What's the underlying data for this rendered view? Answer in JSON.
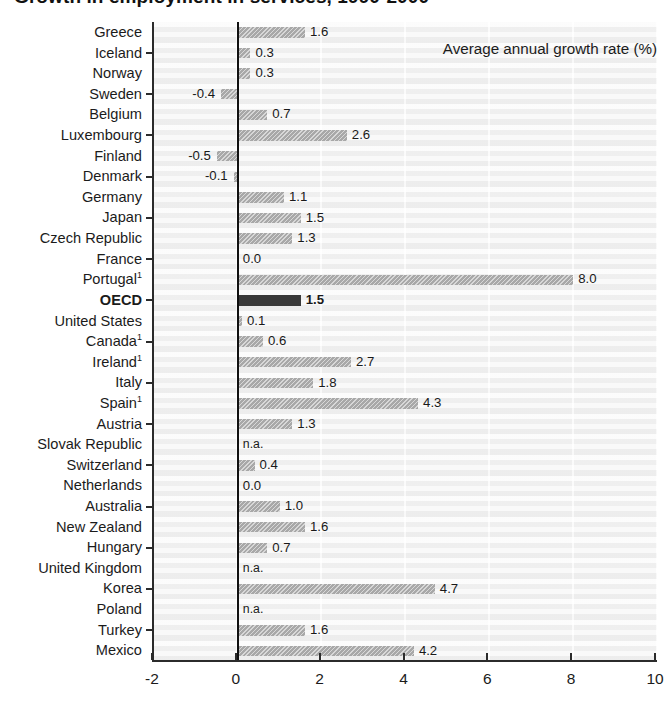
{
  "figure": {
    "title_sliver": "Growth in employment in services, 1990-2000",
    "xaxis_title": "Average annual growth rate (%)",
    "na_text": "n.a.",
    "footnote_marker": "1"
  },
  "colors": {
    "bar": "#a8a8a8",
    "bar_highlight": "#3a3a3a",
    "plot_bg": "#f2f2f2",
    "axis": "#2b2b2b",
    "text": "#1b1b1b"
  },
  "chart_data": {
    "type": "bar",
    "orientation": "horizontal",
    "title": "Growth in employment in services, 1990-2000",
    "xlabel": "Average annual growth rate (%)",
    "ylabel": "",
    "xlim": [
      -2,
      10
    ],
    "xticks": [
      -2,
      0,
      2,
      4,
      6,
      8,
      10
    ],
    "xtick_labels": [
      "-2",
      "0",
      "2",
      "4",
      "6",
      "8",
      "10"
    ],
    "grid": false,
    "legend": null,
    "highlight_category": "OECD",
    "na_label": "n.a.",
    "categories": [
      "Greece",
      "Iceland",
      "Norway",
      "Sweden",
      "Belgium",
      "Luxembourg",
      "Finland",
      "Denmark",
      "Germany",
      "Japan",
      "Czech Republic",
      "France",
      "Portugal",
      "OECD",
      "United States",
      "Canada",
      "Ireland",
      "Italy",
      "Spain",
      "Austria",
      "Slovak Republic",
      "Switzerland",
      "Netherlands",
      "Australia",
      "New Zealand",
      "Hungary",
      "United Kingdom",
      "Korea",
      "Poland",
      "Turkey",
      "Mexico"
    ],
    "values": [
      1.6,
      0.3,
      0.3,
      -0.4,
      0.7,
      2.6,
      -0.5,
      -0.1,
      1.1,
      1.5,
      1.3,
      0.0,
      8.0,
      1.5,
      0.1,
      0.6,
      2.7,
      1.8,
      4.3,
      1.3,
      null,
      0.4,
      0.0,
      1.0,
      1.6,
      0.7,
      null,
      4.7,
      null,
      1.6,
      4.2
    ],
    "value_labels": [
      "1.6",
      "0.3",
      "0.3",
      "-0.4",
      "0.7",
      "2.6",
      "-0.5",
      "-0.1",
      "1.1",
      "1.5",
      "1.3",
      "0.0",
      "8.0",
      "1.5",
      "0.1",
      "0.6",
      "2.7",
      "1.8",
      "4.3",
      "1.3",
      "n.a.",
      "0.4",
      "0.0",
      "1.0",
      "1.6",
      "0.7",
      "n.a.",
      "4.7",
      "n.a.",
      "1.6",
      "4.2"
    ]
  },
  "rows": [
    {
      "label": "Greece",
      "sup": "",
      "value": 1.6,
      "value_label": "1.6",
      "highlight": false
    },
    {
      "label": "Iceland",
      "sup": "",
      "value": 0.3,
      "value_label": "0.3",
      "highlight": false
    },
    {
      "label": "Norway",
      "sup": "",
      "value": 0.3,
      "value_label": "0.3",
      "highlight": false
    },
    {
      "label": "Sweden",
      "sup": "",
      "value": -0.4,
      "value_label": "-0.4",
      "highlight": false
    },
    {
      "label": "Belgium",
      "sup": "",
      "value": 0.7,
      "value_label": "0.7",
      "highlight": false
    },
    {
      "label": "Luxembourg",
      "sup": "",
      "value": 2.6,
      "value_label": "2.6",
      "highlight": false
    },
    {
      "label": "Finland",
      "sup": "",
      "value": -0.5,
      "value_label": "-0.5",
      "highlight": false
    },
    {
      "label": "Denmark",
      "sup": "",
      "value": -0.1,
      "value_label": "-0.1",
      "highlight": false
    },
    {
      "label": "Germany",
      "sup": "",
      "value": 1.1,
      "value_label": "1.1",
      "highlight": false
    },
    {
      "label": "Japan",
      "sup": "",
      "value": 1.5,
      "value_label": "1.5",
      "highlight": false
    },
    {
      "label": "Czech Republic",
      "sup": "",
      "value": 1.3,
      "value_label": "1.3",
      "highlight": false
    },
    {
      "label": "France",
      "sup": "",
      "value": 0.0,
      "value_label": "0.0",
      "highlight": false
    },
    {
      "label": "Portugal",
      "sup": "1",
      "value": 8.0,
      "value_label": "8.0",
      "highlight": false
    },
    {
      "label": "OECD",
      "sup": "",
      "value": 1.5,
      "value_label": "1.5",
      "highlight": true
    },
    {
      "label": "United States",
      "sup": "",
      "value": 0.1,
      "value_label": "0.1",
      "highlight": false
    },
    {
      "label": "Canada",
      "sup": "1",
      "value": 0.6,
      "value_label": "0.6",
      "highlight": false
    },
    {
      "label": "Ireland",
      "sup": "1",
      "value": 2.7,
      "value_label": "2.7",
      "highlight": false
    },
    {
      "label": "Italy",
      "sup": "",
      "value": 1.8,
      "value_label": "1.8",
      "highlight": false
    },
    {
      "label": "Spain",
      "sup": "1",
      "value": 4.3,
      "value_label": "4.3",
      "highlight": false
    },
    {
      "label": "Austria",
      "sup": "",
      "value": 1.3,
      "value_label": "1.3",
      "highlight": false
    },
    {
      "label": "Slovak Republic",
      "sup": "",
      "value": null,
      "value_label": "n.a.",
      "highlight": false
    },
    {
      "label": "Switzerland",
      "sup": "",
      "value": 0.4,
      "value_label": "0.4",
      "highlight": false
    },
    {
      "label": "Netherlands",
      "sup": "",
      "value": 0.0,
      "value_label": "0.0",
      "highlight": false
    },
    {
      "label": "Australia",
      "sup": "",
      "value": 1.0,
      "value_label": "1.0",
      "highlight": false
    },
    {
      "label": "New Zealand",
      "sup": "",
      "value": 1.6,
      "value_label": "1.6",
      "highlight": false
    },
    {
      "label": "Hungary",
      "sup": "",
      "value": 0.7,
      "value_label": "0.7",
      "highlight": false
    },
    {
      "label": "United Kingdom",
      "sup": "",
      "value": null,
      "value_label": "n.a.",
      "highlight": false
    },
    {
      "label": "Korea",
      "sup": "",
      "value": 4.7,
      "value_label": "4.7",
      "highlight": false
    },
    {
      "label": "Poland",
      "sup": "",
      "value": null,
      "value_label": "n.a.",
      "highlight": false
    },
    {
      "label": "Turkey",
      "sup": "",
      "value": 1.6,
      "value_label": "1.6",
      "highlight": false
    },
    {
      "label": "Mexico",
      "sup": "",
      "value": 4.2,
      "value_label": "4.2",
      "highlight": false
    }
  ]
}
